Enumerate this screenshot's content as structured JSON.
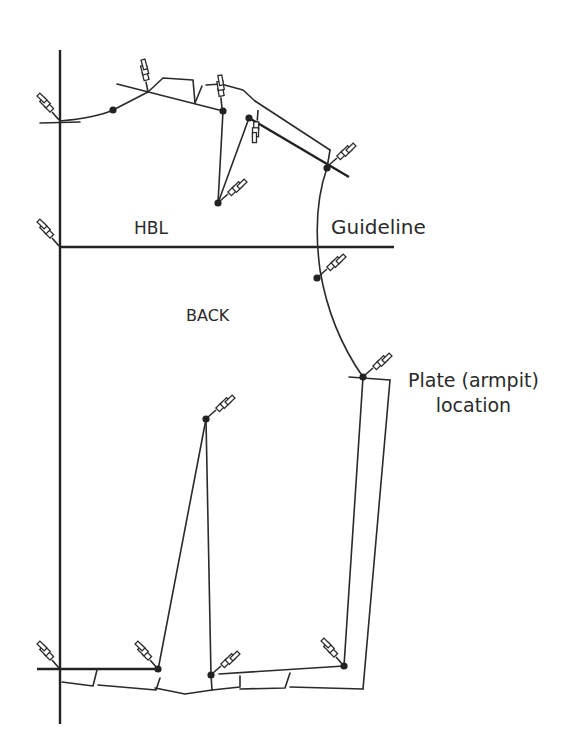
{
  "diagram": {
    "labels": {
      "hbl": "HBL",
      "guideline": "Guideline",
      "back": "BACK",
      "plate_line1": "Plate (armpit)",
      "plate_line2": "location"
    },
    "elements": {
      "center_back_line": "vertical center-back line",
      "hbl_guideline": "horizontal hip/bust level guideline",
      "pins": 15,
      "pivot_dots": 11
    },
    "colors": {
      "ink": "#2a2a2a",
      "background": "#ffffff"
    }
  }
}
